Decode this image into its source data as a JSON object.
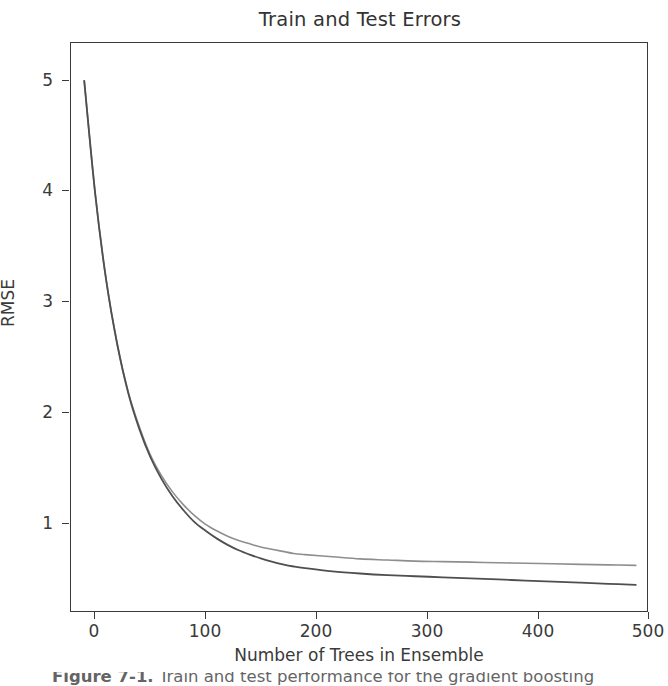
{
  "figure": {
    "title": "Train and Test Errors",
    "background_color": "#ffffff",
    "frame_color": "#3a3a3a"
  },
  "axes": {
    "ylabel": "RMSE",
    "xlabel": "Number of Trees in Ensemble",
    "yticks": [
      "1",
      "2",
      "3",
      "4",
      "5"
    ],
    "xticks": [
      "0",
      "100",
      "200",
      "300",
      "400",
      "500"
    ]
  },
  "caption": {
    "prefix": "Figure 7-1.",
    "text": " Train and test performance for the gradient boosting"
  },
  "chart_data": {
    "type": "line",
    "title": "Train and Test Errors",
    "xlabel": "Number of Trees in Ensemble",
    "ylabel": "RMSE",
    "xlim": [
      -12,
      512
    ],
    "ylim": [
      0.18,
      5.45
    ],
    "xticks": [
      0,
      100,
      200,
      300,
      400,
      500
    ],
    "yticks": [
      1,
      2,
      3,
      4,
      5
    ],
    "grid": false,
    "legend": "none",
    "x": [
      0,
      10,
      20,
      30,
      40,
      50,
      60,
      70,
      80,
      90,
      100,
      110,
      120,
      130,
      140,
      150,
      160,
      170,
      180,
      190,
      200,
      225,
      250,
      275,
      300,
      325,
      350,
      375,
      400,
      425,
      450,
      475,
      500
    ],
    "series": [
      {
        "name": "Test error",
        "color": "#8e8e8e",
        "linewidth": 1.6,
        "values": [
          5.1,
          4.05,
          3.25,
          2.66,
          2.22,
          1.9,
          1.64,
          1.45,
          1.3,
          1.18,
          1.08,
          1.0,
          0.94,
          0.89,
          0.85,
          0.82,
          0.79,
          0.77,
          0.75,
          0.73,
          0.72,
          0.7,
          0.68,
          0.67,
          0.66,
          0.655,
          0.65,
          0.645,
          0.64,
          0.635,
          0.63,
          0.625,
          0.62
        ]
      },
      {
        "name": "Train error",
        "color": "#4f4f4f",
        "linewidth": 1.8,
        "values": [
          5.1,
          4.05,
          3.25,
          2.66,
          2.21,
          1.88,
          1.62,
          1.42,
          1.26,
          1.13,
          1.02,
          0.94,
          0.87,
          0.81,
          0.76,
          0.72,
          0.685,
          0.655,
          0.63,
          0.61,
          0.595,
          0.565,
          0.545,
          0.53,
          0.52,
          0.51,
          0.5,
          0.49,
          0.48,
          0.47,
          0.46,
          0.45,
          0.44
        ]
      }
    ]
  }
}
